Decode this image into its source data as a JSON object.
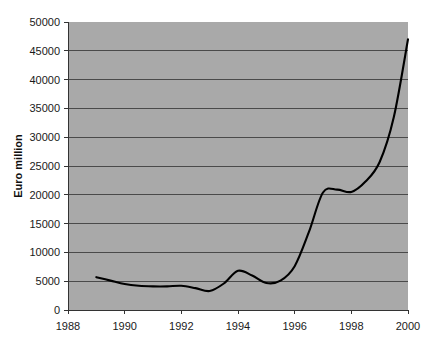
{
  "chart_data": {
    "type": "line",
    "title": "",
    "subtitle": "",
    "xlabel": "",
    "ylabel": "Euro million",
    "xlim": [
      1988,
      2000
    ],
    "ylim": [
      0,
      50000
    ],
    "grid": true,
    "legend": false,
    "legend_position": "none",
    "xticks": [
      "1988",
      "1990",
      "1992",
      "1994",
      "1996",
      "1998",
      "2000"
    ],
    "xtick_values": [
      1988,
      1990,
      1992,
      1994,
      1996,
      1998,
      2000
    ],
    "yticks": [
      "0",
      "5000",
      "10000",
      "15000",
      "20000",
      "25000",
      "30000",
      "35000",
      "40000",
      "45000",
      "50000"
    ],
    "ytick_values": [
      0,
      5000,
      10000,
      15000,
      20000,
      25000,
      30000,
      35000,
      40000,
      45000,
      50000
    ],
    "series": [
      {
        "name": "Euro million",
        "color": "#000000",
        "x": [
          1989.0,
          1989.5,
          1990.0,
          1990.5,
          1991.0,
          1991.5,
          1992.0,
          1992.5,
          1993.0,
          1993.5,
          1994.0,
          1994.5,
          1995.0,
          1995.5,
          1996.0,
          1996.5,
          1997.0,
          1997.5,
          1998.0,
          1998.5,
          1999.0,
          1999.5,
          2000.0
        ],
        "values": [
          5700,
          5100,
          4500,
          4200,
          4100,
          4100,
          4200,
          3800,
          3300,
          4600,
          6800,
          6000,
          4700,
          5100,
          7600,
          13500,
          20400,
          20900,
          20500,
          22300,
          25700,
          33500,
          47000
        ]
      }
    ],
    "annotations": []
  },
  "plot_geometry": {
    "left": 68,
    "right": 408,
    "top": 22,
    "bottom": 310
  },
  "colors": {
    "plot_background": "#a9a9a9",
    "page_background": "#ffffff",
    "gridline": "#4a4a4a",
    "axis": "#333333",
    "series_line": "#000000",
    "text": "#1a1a1a"
  }
}
